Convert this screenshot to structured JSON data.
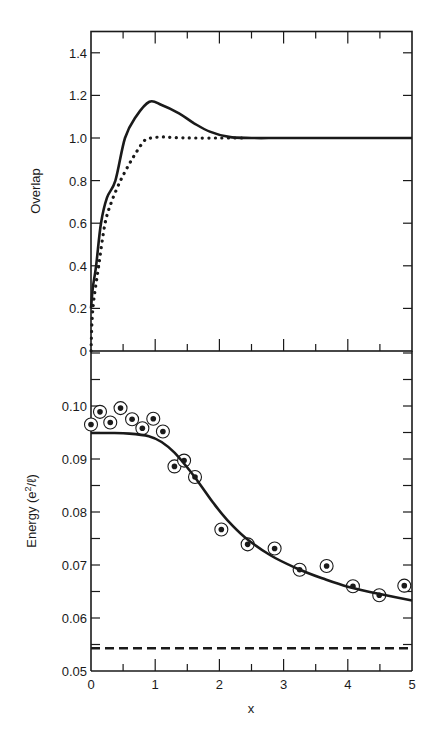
{
  "chart_data": [
    {
      "type": "line",
      "panel": "top",
      "title": "",
      "xlabel": "",
      "ylabel": "Overlap",
      "xlim": [
        0,
        5
      ],
      "ylim": [
        0,
        1.5
      ],
      "grid": false,
      "x_ticks": [
        0,
        0.5,
        1,
        1.5,
        2,
        2.5,
        3,
        3.5,
        4,
        4.5,
        5
      ],
      "y_ticks": [
        0,
        0.2,
        0.4,
        0.6,
        0.8,
        1.0,
        1.2,
        1.4
      ],
      "y_tick_labels": [
        "0",
        "0.2",
        "0.4",
        "0.6",
        "0.8",
        "1.0",
        "1.2",
        "1.4"
      ],
      "series": [
        {
          "name": "solid",
          "style": "solid",
          "x": [
            0,
            0.03,
            0.08,
            0.155,
            0.25,
            0.38,
            0.53,
            0.7,
            0.91,
            1.1,
            1.37,
            1.6,
            1.85,
            2.15,
            2.5,
            3.0,
            4.0,
            5.0
          ],
          "y": [
            0.2,
            0.3,
            0.4,
            0.6,
            0.72,
            0.8,
            1.0,
            1.1,
            1.17,
            1.155,
            1.116,
            1.07,
            1.03,
            1.005,
            1.0,
            1.0,
            1.0,
            1.0
          ]
        },
        {
          "name": "dotted",
          "style": "dotted",
          "x": [
            0,
            0.03,
            0.12,
            0.22,
            0.32,
            0.46,
            0.6,
            0.72,
            0.84,
            0.95,
            1.1,
            1.3,
            1.6,
            2.0,
            2.41
          ],
          "y": [
            0,
            0.2,
            0.4,
            0.6,
            0.7,
            0.8,
            0.88,
            0.94,
            0.99,
            1.0,
            1.005,
            1.002,
            1.0,
            1.0,
            1.0
          ]
        }
      ]
    },
    {
      "type": "scatter",
      "panel": "bottom",
      "title": "",
      "xlabel": "x",
      "ylabel": "Energy (e²/ℓ)",
      "xlim": [
        0,
        5
      ],
      "ylim": [
        0.05,
        0.11
      ],
      "grid": false,
      "x_ticks": [
        0,
        1,
        2,
        3,
        4,
        5
      ],
      "x_tick_labels": [
        "0",
        "1",
        "2",
        "3",
        "4",
        "5"
      ],
      "y_ticks": [
        0.05,
        0.06,
        0.07,
        0.08,
        0.09,
        0.1
      ],
      "y_tick_labels": [
        "0.05",
        "0.06",
        "0.07",
        "0.08",
        "0.09",
        "0.10"
      ],
      "series": [
        {
          "name": "data points",
          "style": "circled-dot markers",
          "x": [
            0.0,
            0.14,
            0.3,
            0.46,
            0.64,
            0.8,
            0.97,
            1.12,
            1.3,
            1.45,
            1.62,
            2.03,
            2.44,
            2.86,
            3.25,
            3.67,
            4.08,
            4.49,
            4.88
          ],
          "y": [
            0.0965,
            0.0989,
            0.0969,
            0.0996,
            0.0975,
            0.0958,
            0.0976,
            0.0952,
            0.0886,
            0.0897,
            0.0866,
            0.0767,
            0.0739,
            0.0731,
            0.0691,
            0.0698,
            0.066,
            0.0643,
            0.0661
          ]
        },
        {
          "name": "solid curve",
          "style": "solid",
          "x": [
            0,
            0.3,
            0.6,
            0.9,
            1.1,
            1.3,
            1.5,
            1.7,
            1.9,
            2.1,
            2.4,
            2.8,
            3.2,
            3.6,
            4.0,
            4.5,
            5.0
          ],
          "y": [
            0.0949,
            0.0949,
            0.0948,
            0.0943,
            0.0932,
            0.0912,
            0.0884,
            0.0852,
            0.0818,
            0.0788,
            0.0752,
            0.0718,
            0.0694,
            0.0675,
            0.0659,
            0.0645,
            0.0633
          ]
        },
        {
          "name": "dashed line",
          "style": "dashed",
          "x": [
            0,
            5
          ],
          "y": [
            0.0543,
            0.0543
          ]
        }
      ]
    }
  ],
  "labels": {
    "top_ylabel": "Overlap",
    "bottom_ylabel_main": "Energy (e",
    "bottom_ylabel_sup": "2",
    "bottom_ylabel_end": "/ℓ)",
    "xlabel": "x"
  }
}
